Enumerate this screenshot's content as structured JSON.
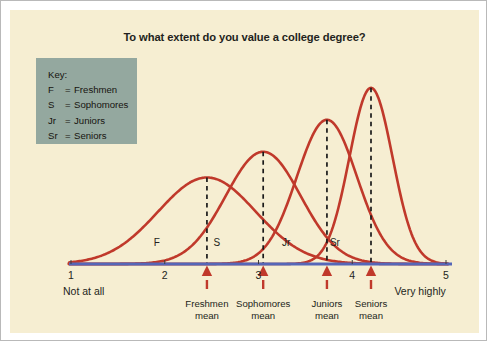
{
  "chart_data": {
    "type": "line",
    "title": "To what extent do you value a college degree?",
    "xlabel": "",
    "ylabel": "",
    "xlim": [
      1,
      5
    ],
    "grid": false,
    "legend_position": "top-left",
    "x_ticks": [
      {
        "value": 1,
        "label": "1"
      },
      {
        "value": 2,
        "label": "2"
      },
      {
        "value": 3,
        "label": "3"
      },
      {
        "value": 4,
        "label": "4"
      },
      {
        "value": 5,
        "label": "5"
      }
    ],
    "x_axis_endpoints": {
      "low": "Not at all",
      "high": "Very highly"
    },
    "series": [
      {
        "name": "Freshmen",
        "abbr": "F",
        "mean": 2.45,
        "std_dev": 0.52,
        "peak_height": 0.42,
        "curve_label": "F",
        "mean_marker_label": "Freshmen\nmean",
        "mean_marker_line1": "Freshmen",
        "mean_marker_line2": "mean"
      },
      {
        "name": "Sophomores",
        "abbr": "S",
        "mean": 3.05,
        "std_dev": 0.4,
        "peak_height": 0.545,
        "curve_label": "S",
        "mean_marker_label": "Sophomores\nmean",
        "mean_marker_line1": "Sophomores",
        "mean_marker_line2": "mean"
      },
      {
        "name": "Juniors",
        "abbr": "Jr",
        "mean": 3.73,
        "std_dev": 0.32,
        "peak_height": 0.7,
        "curve_label": "Jr",
        "mean_marker_label": "Juniors\nmean",
        "mean_marker_line1": "Juniors",
        "mean_marker_line2": "mean"
      },
      {
        "name": "Seniors",
        "abbr": "Sr",
        "mean": 4.2,
        "std_dev": 0.23,
        "peak_height": 0.855,
        "curve_label": "Sr",
        "mean_marker_label": "Seniors\nmean",
        "mean_marker_line1": "Seniors",
        "mean_marker_line2": "mean"
      }
    ],
    "annotations": {
      "mean_markers": "Red triangular arrows on the axis mark each class mean",
      "mean_guides": "Black dashed vertical lines run from each curve peak down to its mean arrow"
    }
  },
  "key": {
    "heading": "Key:",
    "equals": "=",
    "items": [
      {
        "abbr": "F",
        "name": "Freshmen"
      },
      {
        "abbr": "S",
        "name": "Sophomores"
      },
      {
        "abbr": "Jr",
        "name": "Juniors"
      },
      {
        "abbr": "Sr",
        "name": "Seniors"
      }
    ]
  },
  "colors": {
    "panel_background": "#f6eed2",
    "curve": "#c0392b",
    "axis_line": "#5566b8",
    "key_background": "#94a89f",
    "text": "#231f20",
    "dashed_guide": "#1a1a1a",
    "frame_border": "#b9b9b9"
  }
}
